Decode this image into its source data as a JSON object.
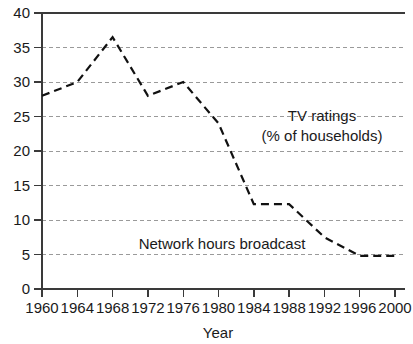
{
  "chart_data": {
    "type": "line",
    "title": "",
    "xlabel": "Year",
    "ylabel": "",
    "x": [
      1960,
      1964,
      1968,
      1972,
      1976,
      1980,
      1984,
      1988,
      1992,
      1996,
      2000
    ],
    "xlim": [
      1960,
      2000
    ],
    "ylim": [
      0,
      40
    ],
    "grid": true,
    "y_ticks": [
      0,
      5,
      10,
      15,
      20,
      25,
      30,
      35,
      40
    ],
    "x_ticks": [
      1960,
      1964,
      1968,
      1972,
      1976,
      1980,
      1984,
      1988,
      1992,
      1996,
      2000
    ],
    "legend_position": "inline-annotation",
    "series": [
      {
        "name": "TV ratings (% of households)",
        "style": "solid",
        "values": [
          28.8,
          25.2,
          27.4,
          20.9,
          27.7,
          24.2,
          21.5,
          19.0,
          21.0,
          16.5,
          14.3
        ]
      },
      {
        "name": "Network hours broadcast",
        "style": "dashed",
        "values": [
          28.0,
          30.0,
          36.5,
          28.0,
          30.0,
          24.0,
          12.3,
          12.3,
          7.5,
          4.8,
          4.8
        ]
      }
    ],
    "annotations": [
      {
        "id": "tv-ratings-label",
        "line1": "TV ratings",
        "line2": "(% of households)"
      },
      {
        "id": "network-hours-label",
        "line1": "Network hours broadcast"
      }
    ]
  },
  "axis": {
    "x_title": "Year",
    "y_tick_labels": [
      "0",
      "5",
      "10",
      "15",
      "20",
      "25",
      "30",
      "35",
      "40"
    ],
    "x_tick_labels": [
      "1960",
      "1964",
      "1968",
      "1972",
      "1976",
      "1980",
      "1984",
      "1988",
      "1992",
      "1996",
      "2000"
    ]
  },
  "annotations": {
    "tv_ratings_line1": "TV ratings",
    "tv_ratings_line2": "(% of households)",
    "network_hours": "Network hours broadcast"
  },
  "colors": {
    "series_stroke": "#111111",
    "grid": "#9a9a9a",
    "axis": "#3a3a3a",
    "text": "#1a1a1a",
    "background": "#ffffff"
  }
}
